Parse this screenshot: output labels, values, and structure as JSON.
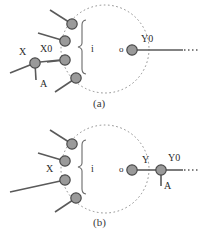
{
  "figure": {
    "type": "diagram",
    "background_color": "#ffffff",
    "node_fill": "#9a9a9a",
    "node_stroke": "#4a4a4a",
    "line_color": "#5a5a5a",
    "dotted_color": "#8c8c8c",
    "text_color": "#2b2b2b"
  },
  "panels": [
    {
      "id": "a",
      "caption": "(a)",
      "bracket_label": "i",
      "output_port_label": "o",
      "labels": [
        {
          "name": "x-label",
          "text": "X"
        },
        {
          "name": "x0-label",
          "text": "X0"
        },
        {
          "name": "a-label",
          "text": "A"
        },
        {
          "name": "y0-label",
          "text": "Y0"
        }
      ],
      "input_ports": 4,
      "fault_node": {
        "name": "X0",
        "stub_label": "A",
        "input_label": "X"
      },
      "output_signal": "Y0"
    },
    {
      "id": "b",
      "caption": "(b)",
      "bracket_label": "i",
      "output_port_label": "o",
      "labels": [
        {
          "name": "x-label",
          "text": "X"
        },
        {
          "name": "y-label",
          "text": "Y"
        },
        {
          "name": "a-label",
          "text": "A"
        },
        {
          "name": "y0-label",
          "text": "Y0"
        }
      ],
      "input_ports": 4,
      "fault_node": {
        "name": "Y0",
        "stub_label": "A",
        "input_label": "Y"
      },
      "output_signal": "Y0"
    }
  ]
}
